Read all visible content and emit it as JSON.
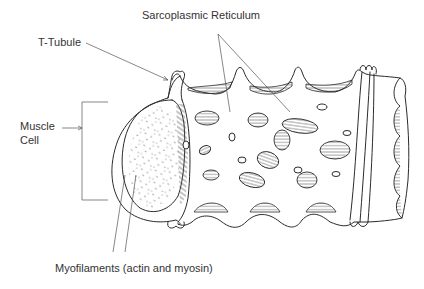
{
  "diagram": {
    "labels": {
      "t_tubule": "T-Tubule",
      "sarcoplasmic_reticulum": "Sarcoplasmic Reticulum",
      "muscle_cell_line1": "Muscle",
      "muscle_cell_line2": "Cell",
      "myofilaments": "Myofilaments (actin and myosin)"
    },
    "colors": {
      "ink": "#2b2b2b",
      "text": "#333333",
      "background": "#ffffff"
    }
  }
}
